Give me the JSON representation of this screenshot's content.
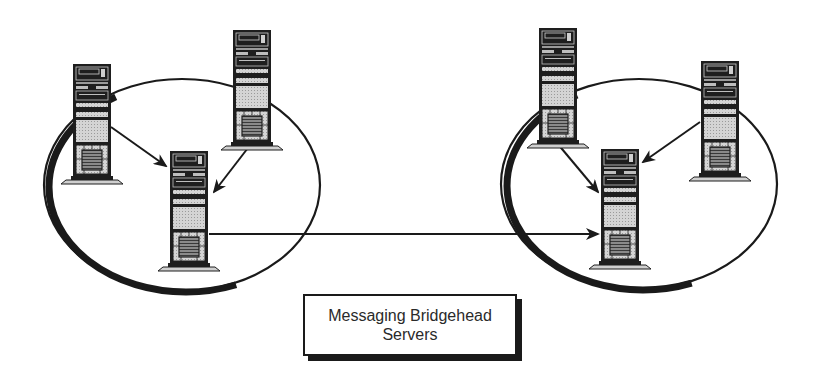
{
  "diagram": {
    "title_label": {
      "line1": "Messaging Bridgehead",
      "line2": "Servers"
    },
    "sites": [
      {
        "name": "site-left",
        "servers": [
          "server-left-a",
          "server-left-b",
          "bridgehead-left"
        ]
      },
      {
        "name": "site-right",
        "servers": [
          "server-right-a",
          "server-right-b",
          "bridgehead-right"
        ]
      }
    ],
    "connections": [
      {
        "from": "server-left-a",
        "to": "bridgehead-left"
      },
      {
        "from": "server-left-b",
        "to": "bridgehead-left"
      },
      {
        "from": "server-right-a",
        "to": "bridgehead-right"
      },
      {
        "from": "server-right-b",
        "to": "bridgehead-right"
      },
      {
        "from": "bridgehead-left",
        "to": "bridgehead-right"
      }
    ],
    "colors": {
      "stroke": "#1a1a1a",
      "panel_gray": "#c8c8c8",
      "background": "#ffffff"
    }
  }
}
